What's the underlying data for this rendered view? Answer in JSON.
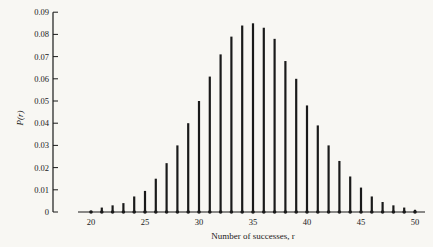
{
  "chart_data": {
    "type": "bar",
    "title": "",
    "xlabel": "Number of successes, r",
    "ylabel": "P(r)",
    "xlim": [
      18,
      51
    ],
    "ylim": [
      0,
      0.09
    ],
    "grid": false,
    "legend": null,
    "x_ticks": [
      20,
      25,
      30,
      35,
      40,
      45,
      50
    ],
    "y_ticks": [
      "0",
      "0.01",
      "0.02",
      "0.03",
      "0.04",
      "0.05",
      "0.06",
      "0.07",
      "0.08",
      "0.09"
    ],
    "x": [
      20,
      21,
      22,
      23,
      24,
      25,
      26,
      27,
      28,
      29,
      30,
      31,
      32,
      33,
      34,
      35,
      36,
      37,
      38,
      39,
      40,
      41,
      42,
      43,
      44,
      45,
      46,
      47,
      48,
      49,
      50
    ],
    "values": [
      0.0005,
      0.002,
      0.003,
      0.004,
      0.007,
      0.0095,
      0.015,
      0.022,
      0.03,
      0.04,
      0.05,
      0.061,
      0.071,
      0.079,
      0.084,
      0.085,
      0.083,
      0.078,
      0.068,
      0.06,
      0.048,
      0.039,
      0.03,
      0.023,
      0.016,
      0.011,
      0.007,
      0.0045,
      0.003,
      0.002,
      0.001
    ],
    "bar_style": "vertical spike lines with dot at base"
  },
  "colors": {
    "background": "#f8f7f3",
    "ink": "#1a1a1a"
  }
}
